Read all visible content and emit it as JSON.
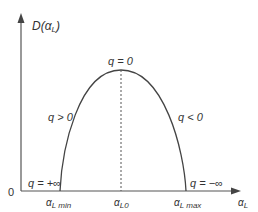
{
  "diagram": {
    "y_axis": {
      "label_main": "D(",
      "label_symbol": "α",
      "label_sub": "L",
      "label_close": ")"
    },
    "x_axis": {
      "symbol": "α",
      "sub": "L"
    },
    "origin": "0",
    "ticks": [
      {
        "symbol": "α",
        "sub": "L min"
      },
      {
        "symbol": "α",
        "sub": "L0"
      },
      {
        "symbol": "α",
        "sub": "L max"
      }
    ],
    "annotations": {
      "peak": "q = 0",
      "left_branch": "q > 0",
      "right_branch": "q < 0",
      "left_end": "q = +∞",
      "right_end": "q = −∞"
    },
    "colors": {
      "curve": "#444444",
      "axis": "#555555",
      "text": "#333333"
    }
  }
}
